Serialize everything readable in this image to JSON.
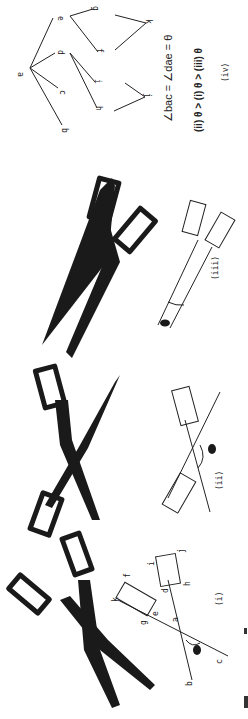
{
  "figure": {
    "orientation": "rotated 90 degrees clockwise",
    "panels": [
      {
        "id": "i",
        "label": "(i)",
        "theta_label": "θ",
        "points": [
          "a",
          "b",
          "c",
          "d",
          "e",
          "f",
          "g",
          "h",
          "i",
          "j",
          "k"
        ]
      },
      {
        "id": "ii",
        "label": "(ii)",
        "theta_label": "θ"
      },
      {
        "id": "iii",
        "label": "(iii)",
        "theta_label": "θ"
      },
      {
        "id": "iv",
        "label": "(iv)",
        "points": [
          "a",
          "b",
          "c",
          "d",
          "e",
          "f",
          "g",
          "h",
          "i",
          "j",
          "k"
        ]
      }
    ],
    "equation_line1": "∠bac = ∠dae = θ",
    "equation_line2": "(ii) θ > (i) θ > (iii) θ",
    "panel_iv_label": "(iv)"
  },
  "labels": {
    "a": "a",
    "b": "b",
    "c": "c",
    "d": "d",
    "e": "e",
    "f": "f",
    "g": "g",
    "h": "h",
    "i": "i",
    "j": "j",
    "k": "k",
    "theta": "θ",
    "panel_i": "(i)",
    "panel_ii": "(ii)",
    "panel_iii": "(iii)"
  },
  "colors": {
    "ink": "#1a1a1a",
    "background": "#ffffff"
  }
}
